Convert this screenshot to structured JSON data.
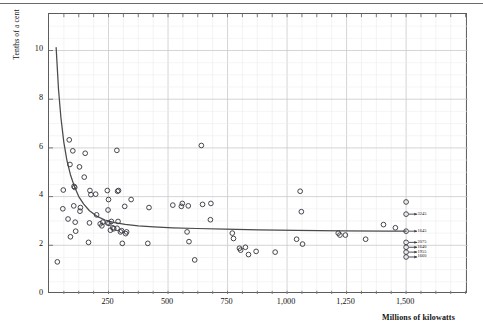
{
  "chart_data": {
    "type": "scatter",
    "title": "",
    "xlabel": "Millions of kilowatts",
    "ylabel": "Tenths of a cent",
    "xlim": [
      0,
      1760
    ],
    "ylim": [
      0,
      11.5
    ],
    "grid": true,
    "legend": "none",
    "xticks": [
      250,
      500,
      750,
      1000,
      1250,
      1500
    ],
    "xticklabels": [
      "250",
      "500",
      "750",
      "1,000",
      "1,250",
      "1,500"
    ],
    "yticks": [
      0,
      2,
      4,
      6,
      8,
      10
    ],
    "yticklabels": [
      "0",
      "2",
      "4",
      "6",
      "8",
      "10"
    ],
    "minor_grid_x_step": 62.5,
    "minor_grid_y_step": 0.5,
    "marker": "open-circle",
    "series": [
      {
        "name": "plants",
        "points": [
          [
            35,
            1.32
          ],
          [
            60,
            4.27
          ],
          [
            58,
            3.5
          ],
          [
            85,
            6.33
          ],
          [
            88,
            5.32
          ],
          [
            80,
            3.08
          ],
          [
            90,
            2.35
          ],
          [
            100,
            5.88
          ],
          [
            105,
            4.42
          ],
          [
            108,
            4.38
          ],
          [
            104,
            3.62
          ],
          [
            110,
            2.95
          ],
          [
            112,
            2.58
          ],
          [
            128,
            5.22
          ],
          [
            132,
            3.55
          ],
          [
            130,
            3.4
          ],
          [
            148,
            4.8
          ],
          [
            152,
            5.78
          ],
          [
            172,
            4.25
          ],
          [
            176,
            4.08
          ],
          [
            170,
            2.92
          ],
          [
            166,
            2.12
          ],
          [
            196,
            4.1
          ],
          [
            200,
            3.25
          ],
          [
            215,
            2.88
          ],
          [
            222,
            2.8
          ],
          [
            226,
            2.95
          ],
          [
            245,
            4.25
          ],
          [
            250,
            3.88
          ],
          [
            248,
            3.45
          ],
          [
            246,
            2.92
          ],
          [
            252,
            2.9
          ],
          [
            262,
            2.98
          ],
          [
            268,
            2.72
          ],
          [
            272,
            2.68
          ],
          [
            258,
            2.62
          ],
          [
            285,
            5.9
          ],
          [
            288,
            4.22
          ],
          [
            292,
            4.25
          ],
          [
            290,
            2.98
          ],
          [
            286,
            2.7
          ],
          [
            300,
            2.55
          ],
          [
            305,
            2.6
          ],
          [
            308,
            2.08
          ],
          [
            318,
            3.6
          ],
          [
            322,
            2.48
          ],
          [
            326,
            2.55
          ],
          [
            345,
            3.88
          ],
          [
            420,
            3.55
          ],
          [
            415,
            2.08
          ],
          [
            520,
            3.65
          ],
          [
            560,
            3.72
          ],
          [
            556,
            3.6
          ],
          [
            580,
            2.55
          ],
          [
            585,
            3.62
          ],
          [
            588,
            2.15
          ],
          [
            612,
            1.4
          ],
          [
            640,
            6.1
          ],
          [
            645,
            3.68
          ],
          [
            680,
            3.72
          ],
          [
            678,
            3.05
          ],
          [
            770,
            2.5
          ],
          [
            775,
            2.28
          ],
          [
            800,
            1.88
          ],
          [
            805,
            1.8
          ],
          [
            825,
            1.92
          ],
          [
            838,
            1.62
          ],
          [
            870,
            1.75
          ],
          [
            950,
            1.72
          ],
          [
            1040,
            2.25
          ],
          [
            1055,
            4.22
          ],
          [
            1060,
            3.38
          ],
          [
            1065,
            2.05
          ],
          [
            1215,
            2.5
          ],
          [
            1222,
            2.42
          ],
          [
            1245,
            2.42
          ],
          [
            1330,
            2.25
          ],
          [
            1405,
            2.85
          ],
          [
            1455,
            2.72
          ],
          [
            1500,
            3.78
          ],
          [
            1500,
            3.28
          ],
          [
            1500,
            2.58
          ],
          [
            1500,
            2.12
          ],
          [
            1500,
            1.92
          ],
          [
            1500,
            1.72
          ],
          [
            1500,
            1.52
          ]
        ]
      }
    ],
    "fit_curve": {
      "name": "fitted-cost-curve",
      "description": "hyperbolic decay from 10.1 to asymptote 2.58",
      "points": [
        [
          30,
          10.12
        ],
        [
          40,
          8.4
        ],
        [
          50,
          7.25
        ],
        [
          62,
          6.25
        ],
        [
          75,
          5.5
        ],
        [
          90,
          4.9
        ],
        [
          108,
          4.38
        ],
        [
          125,
          4.0
        ],
        [
          145,
          3.7
        ],
        [
          170,
          3.42
        ],
        [
          200,
          3.2
        ],
        [
          235,
          3.04
        ],
        [
          275,
          2.93
        ],
        [
          320,
          2.86
        ],
        [
          375,
          2.8
        ],
        [
          440,
          2.76
        ],
        [
          520,
          2.72
        ],
        [
          620,
          2.69
        ],
        [
          740,
          2.66
        ],
        [
          880,
          2.63
        ],
        [
          1040,
          2.61
        ],
        [
          1230,
          2.59
        ],
        [
          1420,
          2.58
        ],
        [
          1500,
          2.58
        ]
      ]
    },
    "annotations": [
      {
        "label": "3245",
        "x": 1500,
        "y": 3.28
      },
      {
        "label": "1645",
        "x": 1500,
        "y": 2.58
      },
      {
        "label": "2075",
        "x": 1500,
        "y": 2.12
      },
      {
        "label": "1640",
        "x": 1500,
        "y": 1.92
      },
      {
        "label": "1955",
        "x": 1500,
        "y": 1.72
      },
      {
        "label": "1660",
        "x": 1500,
        "y": 1.52
      }
    ]
  }
}
